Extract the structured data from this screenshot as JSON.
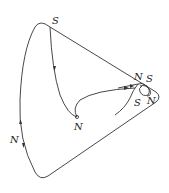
{
  "diagram": {
    "labels": {
      "top_saddle": "S",
      "inner_node": "N",
      "left_node": "N",
      "right_node_upper": "N",
      "right_saddle_upper": "S",
      "right_saddle_lower": "S",
      "right_node_lower": "N"
    },
    "colors": {
      "stroke": "#333333",
      "background": "#ffffff"
    }
  }
}
